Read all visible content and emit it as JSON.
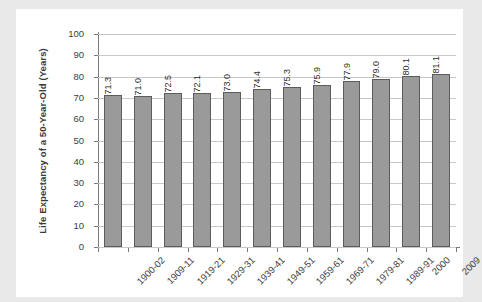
{
  "chart_data": {
    "type": "bar",
    "title": "",
    "xlabel": "",
    "ylabel": "Life Expectancy of a 50-Year-Old (Years)",
    "ylim": [
      0,
      100
    ],
    "yticks": [
      0,
      10,
      20,
      30,
      40,
      50,
      60,
      70,
      80,
      90,
      100
    ],
    "ytick_labels": [
      "0",
      "10",
      "20",
      "30",
      "40",
      "50",
      "60",
      "70",
      "80",
      "90",
      "100"
    ],
    "grid": true,
    "legend": "none",
    "bar_color": "#9a9a9a",
    "bar_edge_color": "#5c5c5c",
    "categories": [
      "1900-02",
      "1909-11",
      "1919-21",
      "1929-31",
      "1939-41",
      "1949-51",
      "1959-61",
      "1969-71",
      "1979-81",
      "1989-91",
      "2000",
      "2009"
    ],
    "values": [
      71.3,
      71.0,
      72.5,
      72.1,
      73.0,
      74.4,
      75.3,
      75.9,
      77.9,
      79.0,
      80.1,
      81.1
    ],
    "data_labels": [
      "71.3",
      "71.0",
      "72.5",
      "72.1",
      "73.0",
      "74.4",
      "75.3",
      "75.9",
      "77.9",
      "79.0",
      "80.1",
      "81.1"
    ]
  }
}
